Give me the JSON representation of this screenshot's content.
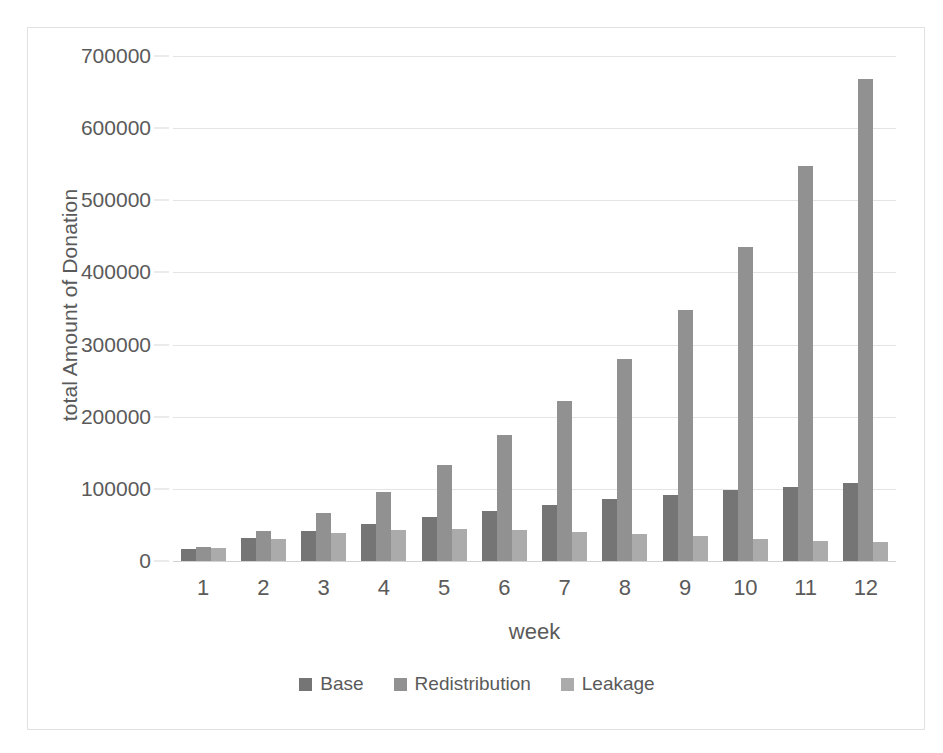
{
  "chart_data": {
    "type": "bar",
    "title": "",
    "xlabel": "week",
    "ylabel": "total Amount of Donation",
    "categories": [
      "1",
      "2",
      "3",
      "4",
      "5",
      "6",
      "7",
      "8",
      "9",
      "10",
      "11",
      "12"
    ],
    "ylim": [
      0,
      700000
    ],
    "yticks": [
      0,
      100000,
      200000,
      300000,
      400000,
      500000,
      600000,
      700000
    ],
    "ytick_labels": [
      "0",
      "100000",
      "200000",
      "300000",
      "400000",
      "500000",
      "600000",
      "700000"
    ],
    "grid": true,
    "legend_position": "bottom",
    "series": [
      {
        "name": "Base",
        "color": "#757575",
        "values": [
          17000,
          32000,
          41000,
          51000,
          61000,
          70000,
          78000,
          86000,
          92000,
          98000,
          103000,
          108000
        ]
      },
      {
        "name": "Redistribution",
        "color": "#919191",
        "values": [
          20000,
          42000,
          67000,
          96000,
          133000,
          174000,
          222000,
          280000,
          348000,
          435000,
          547000,
          668000
        ]
      },
      {
        "name": "Leakage",
        "color": "#ababab",
        "values": [
          18000,
          31000,
          39000,
          43000,
          45000,
          43000,
          40000,
          37000,
          34000,
          31000,
          28000,
          26000
        ]
      }
    ]
  },
  "legend": {
    "items": [
      {
        "label": "Base",
        "swatch": "legend-swatch-base"
      },
      {
        "label": "Redistribution",
        "swatch": "legend-swatch-redistribution"
      },
      {
        "label": "Leakage",
        "swatch": "legend-swatch-leakage"
      }
    ]
  },
  "colors": {
    "base": "#757575",
    "redistribution": "#919191",
    "leakage": "#ababab",
    "gridline": "#e4e4e4",
    "text": "#5a5a5a",
    "frame": "#e2e2e2",
    "background": "#ffffff"
  }
}
